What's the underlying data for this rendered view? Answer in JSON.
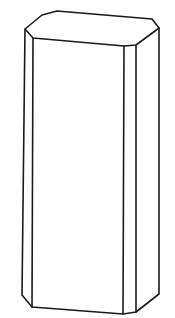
{
  "figure": {
    "subject": "chamfered rectangular prism line drawing",
    "stroke_color": "#1a1a1a",
    "background_color": "#ffffff",
    "outline": [
      [
        57,
        11
      ],
      [
        152,
        19
      ],
      [
        159,
        28
      ],
      [
        159,
        294
      ],
      [
        136,
        312
      ],
      [
        123,
        314
      ],
      [
        32,
        307
      ],
      [
        22,
        295
      ],
      [
        25,
        29
      ],
      [
        42,
        15
      ]
    ],
    "top_front_edge": [
      [
        25,
        29
      ],
      [
        33,
        38
      ],
      [
        124,
        46
      ],
      [
        136,
        45
      ],
      [
        159,
        28
      ]
    ],
    "vertical_edges": [
      [
        [
          33,
          38
        ],
        [
          32,
          307
        ]
      ],
      [
        [
          124,
          46
        ],
        [
          123,
          314
        ]
      ],
      [
        [
          136,
          45
        ],
        [
          136,
          312
        ]
      ]
    ]
  }
}
